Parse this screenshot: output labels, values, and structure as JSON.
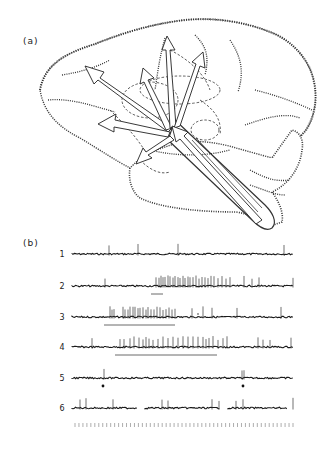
{
  "figure": {
    "panel_a_label": "(a)",
    "panel_b_label": "(b)",
    "panel_a_description": "Lateral view of a brain with arrows indicating projections radiating from the brainstem to cortical regions",
    "colors": {
      "ink": "#1a1a1a",
      "background": "#ffffff"
    }
  },
  "traces": {
    "rows": [
      {
        "label": "1",
        "spikes": [
          109,
          138,
          178,
          284
        ],
        "segments": [
          [
            72,
            293
          ]
        ],
        "underline": null,
        "markers": []
      },
      {
        "label": "2",
        "spikes": [
          105,
          156,
          159,
          161,
          163,
          165,
          168,
          170,
          173,
          175,
          178,
          180,
          183,
          185,
          188,
          190,
          193,
          196,
          199,
          202,
          205,
          208,
          211,
          214,
          218,
          222,
          226,
          230,
          244,
          252,
          259,
          293
        ],
        "segments": [
          [
            72,
            293
          ]
        ],
        "underline": [
          151,
          163
        ],
        "markers": []
      },
      {
        "label": "3",
        "spikes": [
          110,
          112,
          114,
          123,
          125,
          128,
          130,
          133,
          135,
          138,
          140,
          143,
          146,
          148,
          151,
          154,
          157,
          160,
          163,
          166,
          169,
          172,
          175,
          192,
          203,
          212,
          237,
          281
        ],
        "segments": [
          [
            72,
            293
          ]
        ],
        "underline": [
          104,
          175
        ],
        "markers": [
          {
            "x": 198,
            "type": "dot-small"
          }
        ]
      },
      {
        "label": "4",
        "spikes": [
          92,
          120,
          124,
          130,
          134,
          139,
          143,
          146,
          149,
          153,
          158,
          163,
          168,
          173,
          178,
          183,
          188,
          193,
          198,
          203,
          206,
          209,
          213,
          218,
          223,
          227,
          258,
          263,
          270,
          291
        ],
        "segments": [
          [
            72,
            293
          ]
        ],
        "underline": [
          115,
          217
        ],
        "markers": []
      },
      {
        "label": "5",
        "spikes": [
          104,
          242,
          244
        ],
        "segments": [
          [
            72,
            293
          ]
        ],
        "underline": null,
        "markers": [
          {
            "x": 103,
            "type": "dot"
          },
          {
            "x": 243,
            "type": "dot"
          }
        ]
      },
      {
        "label": "6",
        "spikes": [
          80,
          86,
          113,
          162,
          168,
          212,
          219,
          236,
          243,
          293
        ],
        "segments": [
          [
            72,
            137
          ],
          [
            145,
            220
          ],
          [
            228,
            287
          ]
        ],
        "underline": null,
        "markers": []
      }
    ],
    "time_marker_count": 56
  }
}
